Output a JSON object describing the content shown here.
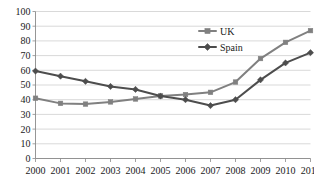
{
  "chart_data": {
    "type": "line",
    "title": "",
    "xlabel": "",
    "ylabel": "",
    "categories": [
      "2000",
      "2001",
      "2002",
      "2003",
      "2004",
      "2005",
      "2006",
      "2007",
      "2008",
      "2009",
      "2010",
      "2011"
    ],
    "x": [
      2000,
      2001,
      2002,
      2003,
      2004,
      2005,
      2006,
      2007,
      2008,
      2009,
      2010,
      2011
    ],
    "ylim": [
      0,
      100
    ],
    "yticks": [
      0,
      10,
      20,
      30,
      40,
      50,
      60,
      70,
      80,
      90,
      100
    ],
    "ytick_labels": [
      "0",
      "10",
      "20",
      "30",
      "40",
      "50",
      "60",
      "70",
      "80",
      "90",
      "100"
    ],
    "grid": true,
    "grid_axis": "y",
    "legend_position": "upper-center",
    "series": [
      {
        "name": "UK",
        "color": "#808080",
        "marker": "square",
        "values": [
          41,
          37.5,
          37,
          38.5,
          40.5,
          42.5,
          43.5,
          45,
          52,
          68,
          79,
          87
        ]
      },
      {
        "name": "Spain",
        "color": "#4d4d4d",
        "marker": "diamond",
        "values": [
          59.5,
          56,
          52.5,
          49,
          47,
          42.5,
          40,
          36,
          40,
          53.5,
          65,
          72
        ]
      }
    ]
  },
  "legend": {
    "items": [
      {
        "label": "UK"
      },
      {
        "label": "Spain"
      }
    ]
  },
  "colors": {
    "uk": "#808080",
    "spain": "#4d4d4d",
    "grid": "#c8c8c8",
    "axis": "#8a8a8a",
    "text": "#1a1a1a",
    "background": "#ffffff"
  }
}
